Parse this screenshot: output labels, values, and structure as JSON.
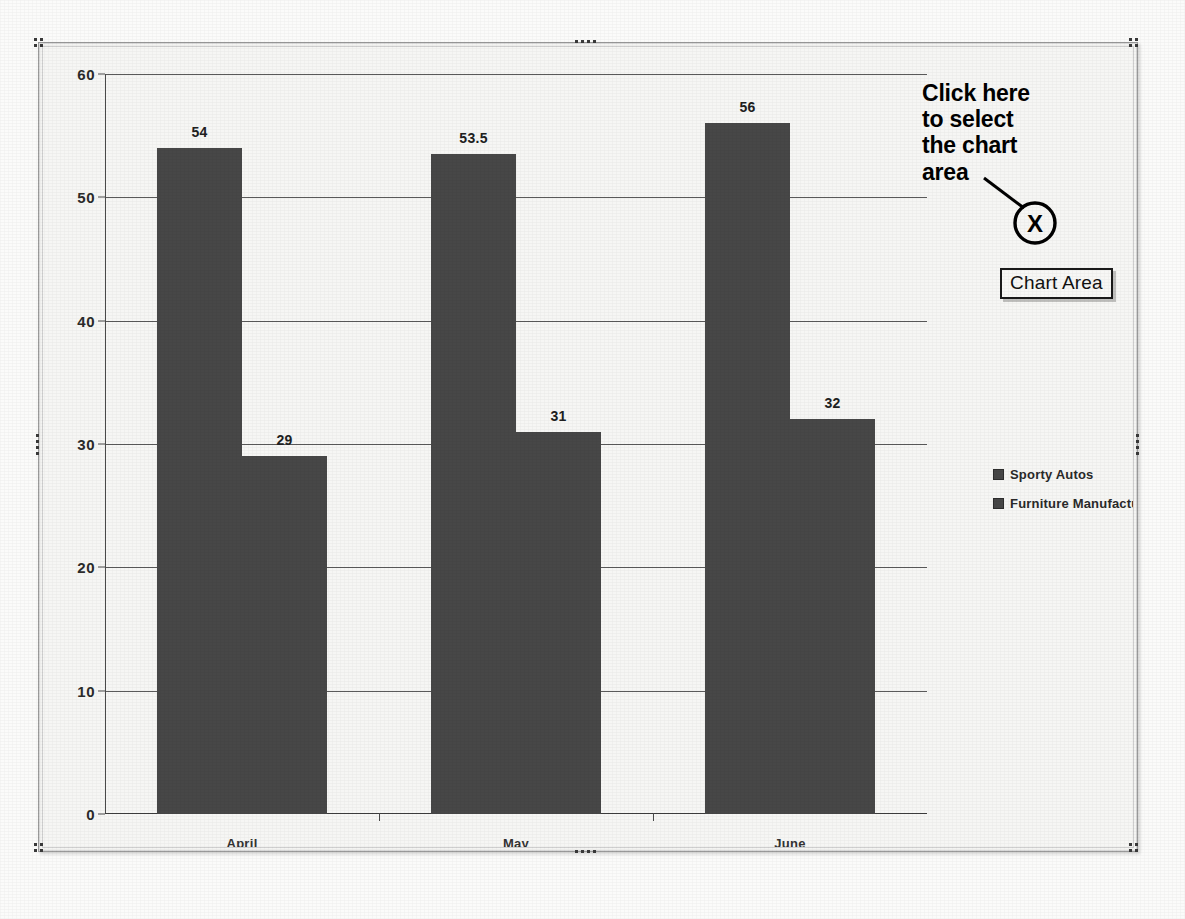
{
  "selection": {
    "label": "chart-object-selection",
    "handle_names": [
      "top-left",
      "top-center",
      "top-right",
      "middle-left",
      "middle-right",
      "bottom-left",
      "bottom-center",
      "bottom-right"
    ]
  },
  "annotation": {
    "text_lines": [
      "Click here",
      "to select",
      "the chart",
      "area"
    ],
    "marker_label": "X",
    "tooltip": "Chart Area"
  },
  "legend": {
    "position": "right",
    "entries": [
      {
        "label": "Sporty Autos",
        "color": "#474747"
      },
      {
        "label": "Furniture Manufacturing",
        "color": "#474747"
      }
    ]
  },
  "chart_data": {
    "type": "bar",
    "title": "",
    "subtitle": "",
    "xlabel": "",
    "ylabel": "",
    "categories": [
      "April",
      "May",
      "June"
    ],
    "series": [
      {
        "name": "Sporty Autos",
        "values": [
          54,
          53.5,
          56
        ],
        "labels": [
          "54",
          "53.5",
          "56"
        ],
        "color": "#474747"
      },
      {
        "name": "Furniture Manufacturing",
        "values": [
          29,
          31,
          32
        ],
        "labels": [
          "29",
          "31",
          "32"
        ],
        "color": "#474747"
      }
    ],
    "ylim": [
      0,
      60
    ],
    "yticks": [
      0,
      10,
      20,
      30,
      40,
      50,
      60
    ],
    "ytick_labels": [
      "0",
      "10",
      "20",
      "30",
      "40",
      "50",
      "60"
    ],
    "grid": true,
    "grid_axis": "y",
    "legend_position": "right",
    "data_labels": true,
    "bar_gap_within_group": 0,
    "plot_background": "#f6f6f4"
  },
  "colors": {
    "bar": "#474747",
    "gridline": "#5a5a5a",
    "axis": "#3d3d3d",
    "chart_background": "#f6f6f4",
    "page_background": "#fbfbfa",
    "annotation": "#000000"
  }
}
